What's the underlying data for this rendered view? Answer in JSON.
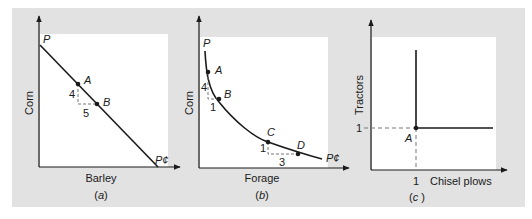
{
  "figure": {
    "background_color": "#e2e2e2",
    "plot_bg_color": "#ffffff",
    "line_color": "#1a1a1a"
  },
  "panels": [
    {
      "id": "a",
      "caption_open": "(",
      "caption_letter": "a",
      "caption_close": ")",
      "xlabel": "Barley",
      "ylabel": "Corn",
      "curve_start_label": "P",
      "curve_end_label": "P¢",
      "points": [
        {
          "label": "A"
        },
        {
          "label": "B"
        }
      ],
      "rise_label": "4",
      "run_label": "5"
    },
    {
      "id": "b",
      "caption_open": "(",
      "caption_letter": "b",
      "caption_close": ")",
      "xlabel": "Forage",
      "ylabel": "Corn",
      "curve_start_label": "P",
      "curve_end_label": "P¢",
      "points": [
        {
          "label": "A"
        },
        {
          "label": "B"
        },
        {
          "label": "C"
        },
        {
          "label": "D"
        }
      ],
      "ab_rise_label": "4",
      "ab_run_label": "1",
      "cd_rise_label": "1",
      "cd_run_label": "3"
    },
    {
      "id": "c",
      "caption_open": "(",
      "caption_letter": "c",
      "caption_close": " )",
      "xlabel": "Chisel plows",
      "ylabel": "Tractors",
      "x_tick": "1",
      "y_tick": "1",
      "points": [
        {
          "label": "A"
        }
      ]
    }
  ]
}
